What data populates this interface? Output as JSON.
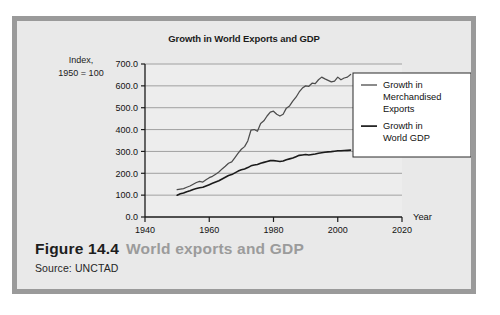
{
  "figure": {
    "number_label": "Figure 14.4",
    "title": "World exports and GDP",
    "source": "Source: UNCTAD"
  },
  "colors": {
    "frame_border": "#9a9a9a",
    "figure_background": "#e9e9e9",
    "plot_background": "#ededed",
    "gridline": "#8d8d8d",
    "axis": "#1b1b1b",
    "exports_line": "#4c4c4c",
    "gdp_line": "#1b1b1b",
    "legend_background": "#ffffff",
    "legend_border": "#2a2a2a",
    "caption_title": "#9b9b9b",
    "caption_number": "#1d1d1d"
  },
  "chart_data": {
    "type": "line",
    "title": "Growth in World Exports and GDP",
    "xlabel": "Year",
    "ylabel_lines": [
      "Index,",
      "1950 = 100"
    ],
    "xlim": [
      1940,
      2020
    ],
    "ylim": [
      0.0,
      700.0
    ],
    "xticks": [
      1940,
      1960,
      1980,
      2000,
      2020
    ],
    "xtick_labels": [
      "1940",
      "1960",
      "1980",
      "2000",
      "2020"
    ],
    "yticks": [
      0.0,
      100.0,
      200.0,
      300.0,
      400.0,
      500.0,
      600.0,
      700.0
    ],
    "ytick_labels": [
      "0.0",
      "100.0",
      "200.0",
      "300.0",
      "400.0",
      "500.0",
      "600.0",
      "700.0"
    ],
    "grid": true,
    "grid_axis": "y",
    "legend_position": "upper right",
    "x": [
      1950,
      1951,
      1952,
      1953,
      1954,
      1955,
      1956,
      1957,
      1958,
      1959,
      1960,
      1961,
      1962,
      1963,
      1964,
      1965,
      1966,
      1967,
      1968,
      1969,
      1970,
      1971,
      1972,
      1973,
      1974,
      1975,
      1976,
      1977,
      1978,
      1979,
      1980,
      1981,
      1982,
      1983,
      1984,
      1985,
      1986,
      1987,
      1988,
      1989,
      1990,
      1991,
      1992,
      1993,
      1994,
      1995,
      1996,
      1997,
      1998,
      1999,
      2000,
      2001,
      2002,
      2003,
      2004
    ],
    "series": [
      {
        "name": "Growth in Merchandised Exports",
        "legend_lines": [
          "Growth in",
          "Merchandised",
          "Exports"
        ],
        "color": "#4c4c4c",
        "values": [
          125,
          128,
          130,
          136,
          142,
          150,
          158,
          163,
          160,
          170,
          180,
          186,
          196,
          206,
          220,
          232,
          246,
          252,
          272,
          292,
          310,
          322,
          348,
          398,
          400,
          392,
          428,
          440,
          462,
          480,
          484,
          470,
          462,
          470,
          498,
          508,
          530,
          548,
          572,
          590,
          600,
          598,
          612,
          610,
          628,
          640,
          632,
          625,
          618,
          622,
          640,
          628,
          636,
          640,
          652
        ]
      },
      {
        "name": "Growth in World GDP",
        "legend_lines": [
          "Growth in",
          "World GDP"
        ],
        "color": "#1b1b1b",
        "values": [
          100,
          106,
          110,
          116,
          120,
          126,
          130,
          134,
          136,
          142,
          148,
          154,
          160,
          166,
          174,
          182,
          190,
          194,
          202,
          210,
          216,
          220,
          226,
          234,
          238,
          240,
          246,
          250,
          254,
          258,
          258,
          256,
          254,
          256,
          262,
          266,
          270,
          276,
          282,
          284,
          286,
          284,
          286,
          288,
          292,
          294,
          296,
          298,
          299,
          301,
          303,
          303,
          304,
          305,
          306
        ]
      }
    ]
  }
}
